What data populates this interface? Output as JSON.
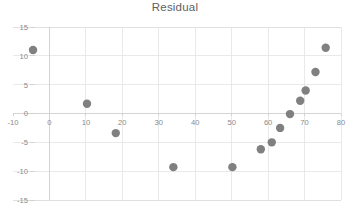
{
  "chart_data": {
    "type": "scatter",
    "title": "Residual",
    "xlabel": "",
    "ylabel": "",
    "xlim": [
      -10,
      80
    ],
    "ylim": [
      -15,
      15
    ],
    "xticks": [
      -10,
      0,
      10,
      20,
      30,
      40,
      50,
      60,
      70,
      80
    ],
    "xticklabels": [
      "-10",
      "0",
      "10",
      "20",
      "30",
      "40",
      "50",
      "60",
      "70",
      "80"
    ],
    "yticks": [
      -15,
      -10,
      -5,
      0,
      5,
      10,
      15
    ],
    "yticklabels": [
      "-15",
      "-10",
      "-5",
      "0",
      "5",
      "10",
      "15"
    ],
    "grid": true,
    "legend": false,
    "marker_color": "#808080",
    "marker_size": 4.2,
    "series": [
      {
        "name": "Residual",
        "points": [
          [
            -4.5,
            11.0
          ],
          [
            10.3,
            1.7
          ],
          [
            18.2,
            -3.4
          ],
          [
            34.0,
            -9.3
          ],
          [
            50.2,
            -9.3
          ],
          [
            58.0,
            -6.2
          ],
          [
            61.0,
            -5.0
          ],
          [
            63.3,
            -2.5
          ],
          [
            66.0,
            -0.1
          ],
          [
            68.8,
            2.2
          ],
          [
            70.3,
            4.0
          ],
          [
            73.0,
            7.2
          ],
          [
            75.8,
            11.4
          ]
        ]
      }
    ]
  },
  "colors": {
    "marker": "#808080",
    "grid": "#e4e4e4",
    "axis": "#cfcfcf",
    "text": "#8a8a8a",
    "title": "#606060",
    "background": "#ffffff"
  }
}
